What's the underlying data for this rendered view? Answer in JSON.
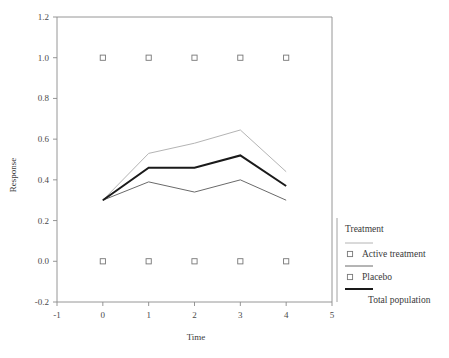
{
  "chart_data": {
    "type": "line",
    "title": "",
    "xlabel": "Time",
    "ylabel": "Response",
    "xlim": [
      -1,
      5
    ],
    "ylim": [
      -0.2,
      1.2
    ],
    "xticks": [
      "-1",
      "0",
      "1",
      "2",
      "3",
      "4",
      "5"
    ],
    "xtick_values": [
      -1,
      0,
      1,
      2,
      3,
      4,
      5
    ],
    "yticks": [
      "-0.2",
      "0.0",
      "0.2",
      "0.4",
      "0.6",
      "0.8",
      "1.0",
      "1.2"
    ],
    "ytick_values": [
      -0.2,
      0.0,
      0.2,
      0.4,
      0.6,
      0.8,
      1.0,
      1.2
    ],
    "grid": false,
    "legend_position": "right",
    "x": [
      0,
      1,
      2,
      3,
      4
    ],
    "series": [
      {
        "name": "Active treatment",
        "values": [
          0.3,
          0.53,
          0.58,
          0.645,
          0.44
        ],
        "color": "#b4b4b4",
        "width": 1.0,
        "marker": "square-open"
      },
      {
        "name": "Placebo",
        "values": [
          0.3,
          0.39,
          0.34,
          0.4,
          0.3
        ],
        "color": "#6a6a6a",
        "width": 1.0,
        "marker": "square-open"
      },
      {
        "name": "Total population",
        "values": [
          0.3,
          0.46,
          0.46,
          0.52,
          0.37
        ],
        "color": "#1a1a1a",
        "width": 2.0,
        "marker": "none"
      }
    ],
    "marker_rows": [
      {
        "y": 1.0,
        "x": [
          0,
          1,
          2,
          3,
          4
        ]
      },
      {
        "y": 0.0,
        "x": [
          0,
          1,
          2,
          3,
          4
        ]
      }
    ]
  },
  "legend": {
    "title": "Treatment",
    "entries": [
      {
        "label": "Active treatment",
        "color": "#b4b4b4",
        "has_marker": true
      },
      {
        "label": "Placebo",
        "color": "#6a6a6a",
        "has_marker": true
      },
      {
        "label": "Total population",
        "color": "#1a1a1a",
        "has_marker": false
      }
    ]
  },
  "axes": {
    "x_title": "Time",
    "y_title": "Response"
  }
}
